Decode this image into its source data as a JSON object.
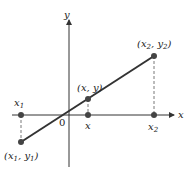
{
  "diagram": {
    "axes": {
      "x_label": "x",
      "y_label": "y",
      "origin_label": "0"
    },
    "points": [
      {
        "id": "p1",
        "label_open": "(",
        "label_x": "x",
        "label_x_sub": "1",
        "label_sep": ", ",
        "label_y": "y",
        "label_y_sub": "1",
        "label_close": ")",
        "axis_label": "x",
        "axis_label_sub": "1"
      },
      {
        "id": "p",
        "label_open": "(",
        "label_x": "x",
        "label_sep": ", ",
        "label_y": "y",
        "label_close": ")",
        "axis_label": "x"
      },
      {
        "id": "p2",
        "label_open": "(",
        "label_x": "x",
        "label_x_sub": "2",
        "label_sep": ", ",
        "label_y": "y",
        "label_y_sub": "2",
        "label_close": ")",
        "axis_label": "x",
        "axis_label_sub": "2"
      }
    ],
    "colors": {
      "line": "#333333",
      "axis": "#333333",
      "point": "#444444"
    }
  }
}
